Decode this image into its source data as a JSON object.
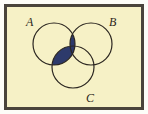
{
  "figure": {
    "name": "three-set-venn-diagram",
    "width": 148,
    "height": 114
  },
  "colors": {
    "background": "#f6f1c6",
    "frame_border": "#4a443b",
    "page": "#fdfdf8",
    "circle_stroke": "#2b2620",
    "shade_fill": "#2d3a6b",
    "label_color": "#2b2620"
  },
  "sets": [
    {
      "id": "A",
      "label": "A",
      "cx": 54,
      "cy": 44,
      "r": 21
    },
    {
      "id": "B",
      "label": "B",
      "cx": 91,
      "cy": 44,
      "r": 21
    },
    {
      "id": "C",
      "label": "C",
      "cx": 73,
      "cy": 67,
      "r": 21
    }
  ],
  "labels": {
    "a": "A",
    "b": "B",
    "c": "C"
  },
  "shaded_regions": [
    {
      "id": "A-inter-B",
      "description": "A intersect B",
      "shaded": true
    },
    {
      "id": "A-inter-C",
      "description": "A intersect C",
      "shaded": true
    },
    {
      "id": "B-inter-C",
      "description": "B intersect C",
      "shaded": false
    },
    {
      "id": "A-inter-B-inter-C",
      "description": "A intersect B intersect C",
      "shaded": true
    }
  ],
  "chart_data": {
    "type": "diagram",
    "sets": [
      "A",
      "B",
      "C"
    ],
    "shaded": [
      "A∩B",
      "A∩C",
      "A∩B∩C"
    ],
    "unshaded": [
      "A only",
      "B only",
      "C only",
      "B∩C only"
    ],
    "legend": "",
    "grid": false
  }
}
